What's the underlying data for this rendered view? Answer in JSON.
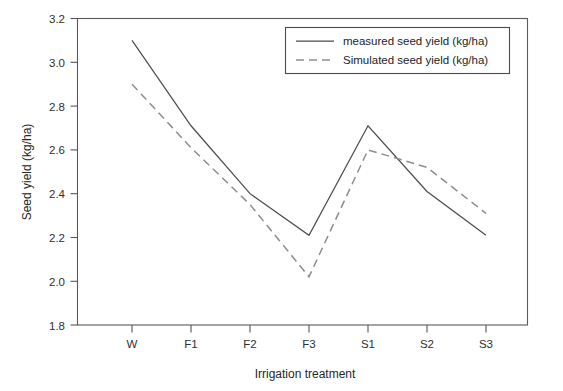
{
  "chart_data": {
    "type": "line",
    "title": "",
    "subtitle": "",
    "xlabel": "Irrigation treatment",
    "ylabel": "Seed yield (kg/ha)",
    "categories": [
      "W",
      "F1",
      "F2",
      "F3",
      "S1",
      "S2",
      "S3"
    ],
    "ylim": [
      1.8,
      3.2
    ],
    "ytick_labels": [
      "1.8",
      "2.0",
      "2.2",
      "2.4",
      "2.6",
      "2.8",
      "3.0",
      "3.2"
    ],
    "ytick_values": [
      1.8,
      2.0,
      2.2,
      2.4,
      2.6,
      2.8,
      3.0,
      3.2
    ],
    "grid": false,
    "legend_position": "top-right",
    "series": [
      {
        "name": "measured seed yield (kg/ha)",
        "style": "solid",
        "color": "#4d4d4d",
        "values": [
          3.1,
          2.71,
          2.4,
          2.21,
          2.71,
          2.41,
          2.21
        ]
      },
      {
        "name": "Simulated seed yield (kg/ha)",
        "style": "dashed",
        "color": "#8d8d8d",
        "values": [
          2.9,
          2.61,
          2.35,
          2.02,
          2.6,
          2.52,
          2.31
        ]
      }
    ]
  },
  "legend": {
    "entries": [
      {
        "label": "measured seed yield (kg/ha)"
      },
      {
        "label": "Simulated seed yield (kg/ha)"
      }
    ]
  },
  "axes": {
    "x_title": "Irrigation treatment",
    "y_title": "Seed yield (kg/ha)",
    "x_tick_labels": [
      "W",
      "F1",
      "F2",
      "F3",
      "S1",
      "S2",
      "S3"
    ],
    "y_tick_labels": [
      "3.2",
      "3.0",
      "2.8",
      "2.6",
      "2.4",
      "2.2",
      "2.0",
      "1.8"
    ]
  }
}
